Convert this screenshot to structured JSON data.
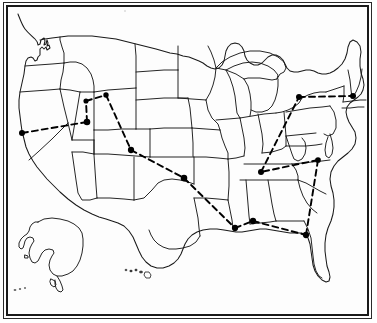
{
  "figure": {
    "type": "map",
    "frame": {
      "style": "double-rule-rectangle",
      "outer_color": "#2a2a2a",
      "inner_color": "#1a1a1a"
    },
    "colors": {
      "background": "#ffffff",
      "state_outline": "#1a1a1a",
      "route_line": "#000000",
      "marker_fill": "#000000"
    },
    "line_styles": {
      "state_border": "solid",
      "route": "dashed"
    }
  },
  "map": {
    "regions": [
      {
        "name": "contiguous-united-states",
        "label": "Contiguous United States"
      },
      {
        "name": "alaska-inset",
        "label": "Alaska"
      },
      {
        "name": "hawaii-inset",
        "label": "Hawaii"
      }
    ],
    "markers": [
      {
        "id": "m1",
        "name": "marker-west-coast-bay-area",
        "x": 22,
        "y": 133,
        "size": 4.2
      },
      {
        "id": "m2",
        "name": "marker-idaho",
        "x": 86,
        "y": 101,
        "size": 3.6
      },
      {
        "id": "m3",
        "name": "marker-montana-wyoming",
        "x": 106,
        "y": 95,
        "size": 3.8
      },
      {
        "id": "m4",
        "name": "marker-salt-lake-city",
        "x": 87,
        "y": 122,
        "size": 4.6
      },
      {
        "id": "m5",
        "name": "marker-denver",
        "x": 131,
        "y": 150,
        "size": 4.4
      },
      {
        "id": "m6",
        "name": "marker-arkansas-oklahoma",
        "x": 184,
        "y": 178,
        "size": 4.6
      },
      {
        "id": "m7",
        "name": "marker-tennessee-nashville",
        "x": 261,
        "y": 172,
        "size": 4.2
      },
      {
        "id": "m8",
        "name": "marker-great-lakes-detroit",
        "x": 299,
        "y": 97,
        "size": 4.2
      },
      {
        "id": "m9",
        "name": "marker-boston-northeast",
        "x": 353,
        "y": 96,
        "size": 4.2
      },
      {
        "id": "m10",
        "name": "marker-carolina-coast",
        "x": 318,
        "y": 160,
        "size": 4.0
      },
      {
        "id": "m11",
        "name": "marker-new-orleans",
        "x": 235,
        "y": 228,
        "size": 4.4
      },
      {
        "id": "m12",
        "name": "marker-mobile-pensacola",
        "x": 253,
        "y": 221,
        "size": 4.4
      },
      {
        "id": "m13",
        "name": "marker-florida-tampa",
        "x": 306,
        "y": 235,
        "size": 4.4
      }
    ],
    "routes": [
      {
        "name": "route-bay-area-to-salt-lake",
        "from": "m1",
        "to": "m4"
      },
      {
        "name": "route-salt-lake-to-idaho",
        "from": "m4",
        "to": "m2"
      },
      {
        "name": "route-idaho-to-montana",
        "from": "m2",
        "to": "m3"
      },
      {
        "name": "route-montana-to-denver",
        "from": "m3",
        "to": "m5"
      },
      {
        "name": "route-denver-to-arkansas",
        "from": "m5",
        "to": "m6"
      },
      {
        "name": "route-arkansas-to-new-orleans",
        "from": "m6",
        "to": "m11"
      },
      {
        "name": "route-new-orleans-to-mobile",
        "from": "m11",
        "to": "m12"
      },
      {
        "name": "route-mobile-to-florida",
        "from": "m12",
        "to": "m13"
      },
      {
        "name": "route-florida-to-carolina",
        "from": "m13",
        "to": "m10"
      },
      {
        "name": "route-carolina-to-tennessee",
        "from": "m10",
        "to": "m7"
      },
      {
        "name": "route-tennessee-to-great-lakes",
        "from": "m7",
        "to": "m8"
      },
      {
        "name": "route-great-lakes-to-boston",
        "from": "m8",
        "to": "m9"
      }
    ],
    "hawaii_islands": [
      {
        "x": 126,
        "y": 270,
        "w": 2.0,
        "h": 1.4
      },
      {
        "x": 131,
        "y": 271,
        "w": 2.4,
        "h": 1.6
      },
      {
        "x": 136,
        "y": 270,
        "w": 2.2,
        "h": 1.8
      },
      {
        "x": 141,
        "y": 272,
        "w": 3.0,
        "h": 2.0
      },
      {
        "x": 147,
        "y": 274,
        "w": 4.0,
        "h": 3.2
      }
    ],
    "aleutian_dots": [
      {
        "x": 15,
        "y": 290,
        "w": 2.6,
        "h": 1.6
      },
      {
        "x": 20,
        "y": 289,
        "w": 2.2,
        "h": 1.4
      },
      {
        "x": 25,
        "y": 288,
        "w": 2.0,
        "h": 1.4
      }
    ]
  }
}
